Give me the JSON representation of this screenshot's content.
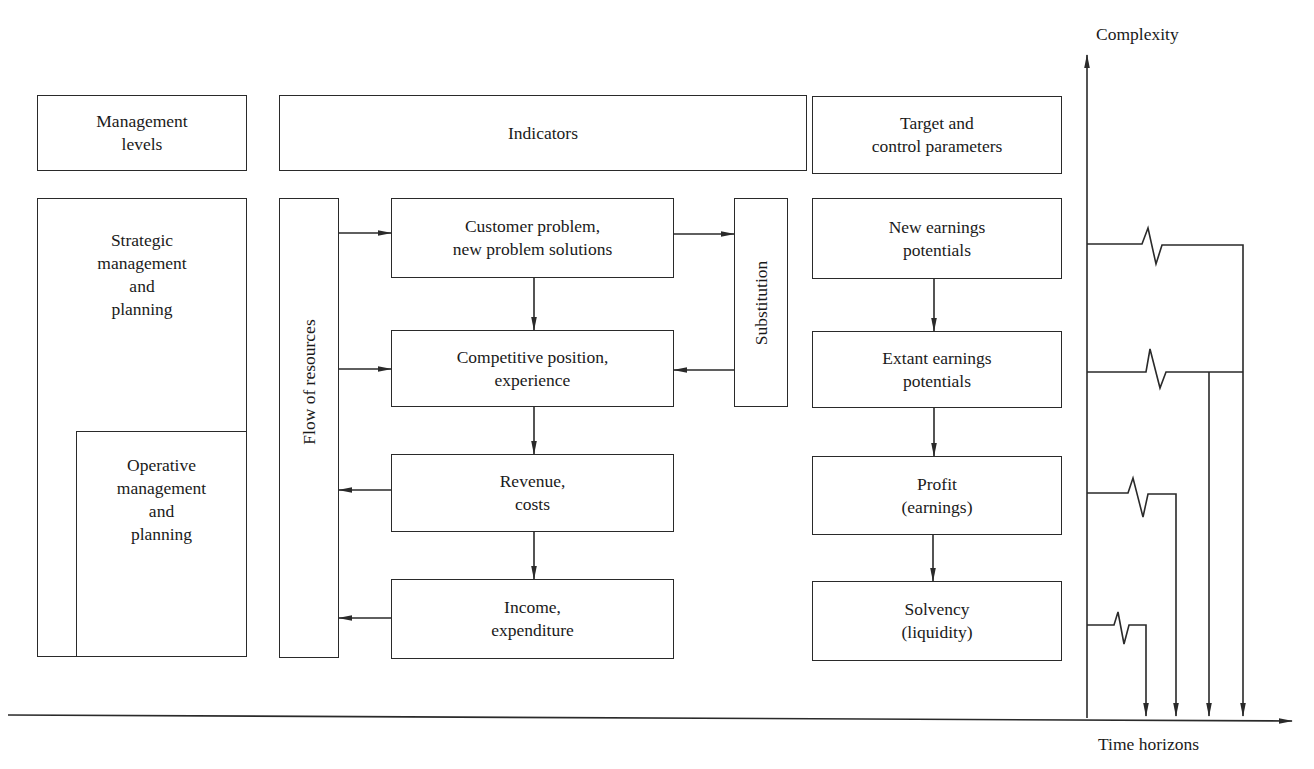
{
  "headers": {
    "management_levels": "Management\nlevels",
    "indicators": "Indicators",
    "target": "Target and\ncontrol parameters"
  },
  "management": {
    "strategic": "Strategic\nmanagement\nand\nplanning",
    "operative": "Operative\nmanagement\nand\nplanning"
  },
  "flow_of_resources": "Flow of resources",
  "substitution": "Substitution",
  "indicators": [
    {
      "id": "customer",
      "label": "Customer problem,\nnew problem solutions"
    },
    {
      "id": "competitive",
      "label": "Competitive position,\nexperience"
    },
    {
      "id": "revenue",
      "label": "Revenue,\ncosts"
    },
    {
      "id": "income",
      "label": "Income,\nexpenditure"
    }
  ],
  "targets": [
    {
      "id": "new-earnings",
      "label": "New earnings\npotentials"
    },
    {
      "id": "extant-earnings",
      "label": "Extant earnings\npotentials"
    },
    {
      "id": "profit",
      "label": "Profit\n(earnings)"
    },
    {
      "id": "solvency",
      "label": "Solvency\n(liquidity)"
    }
  ],
  "axes": {
    "y_label": "Complexity",
    "x_label": "Time horizons"
  },
  "colors": {
    "line": "#2a2a2a",
    "background": "#ffffff"
  }
}
